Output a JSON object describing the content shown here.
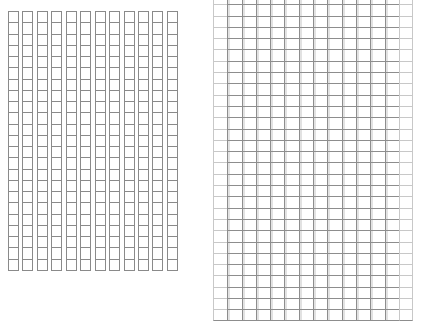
{
  "canvas": {
    "width": 424,
    "height": 330,
    "background": "#ffffff"
  },
  "colors": {
    "line": "#8a8a8a",
    "line_light": "#c8c8c8"
  },
  "grids": [
    {
      "name": "left-grid",
      "columns": 12,
      "rows": 23,
      "x": 8,
      "y": 11,
      "width": 173,
      "height": 259
    },
    {
      "name": "right-grid",
      "columns": 14,
      "rows": 29,
      "x": 213,
      "y": 0,
      "width": 200,
      "height": 316
    }
  ]
}
